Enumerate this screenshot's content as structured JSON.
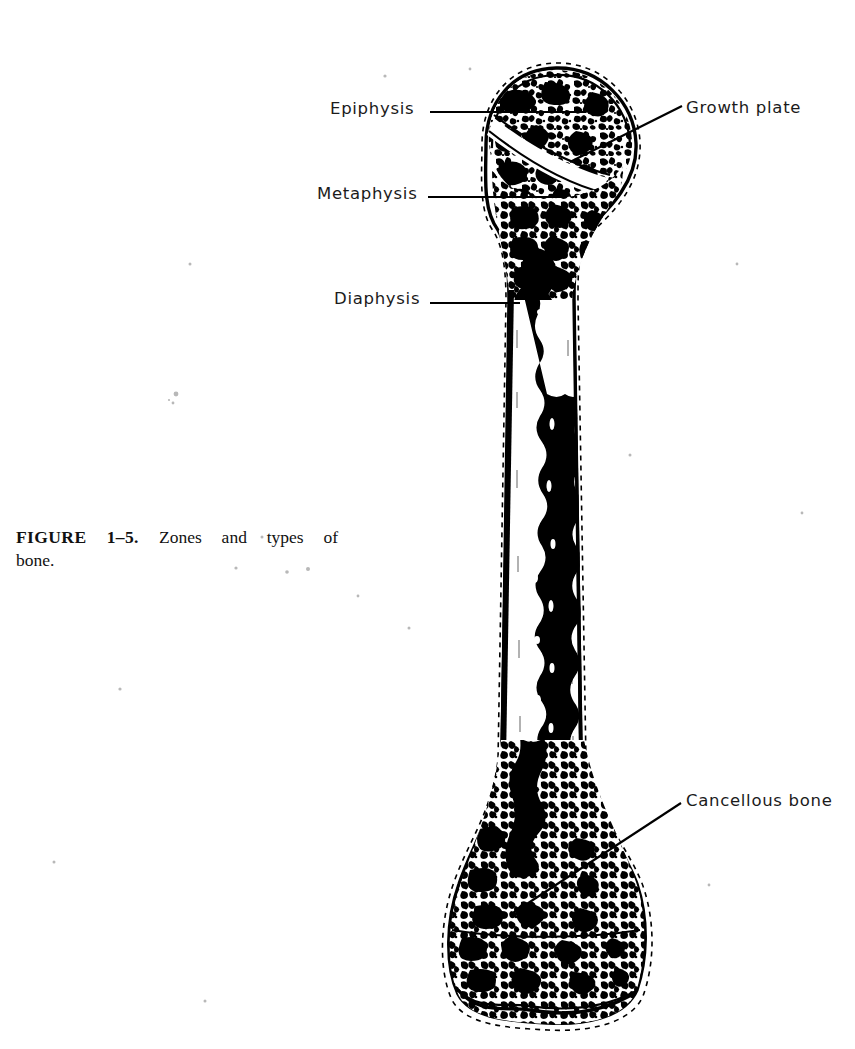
{
  "figure": {
    "caption_number": "FIGURE 1–5.",
    "caption_line1_rest": "Zones and types of",
    "caption_line2": "bone."
  },
  "labels": {
    "epiphysis": "Epiphysis",
    "metaphysis": "Metaphysis",
    "diaphysis": "Diaphysis",
    "growth_plate": "Growth plate",
    "cancellous_bone": "Cancellous bone"
  },
  "colors": {
    "ink": "#000000",
    "paper": "#ffffff",
    "text": "#1b1b1b",
    "speck": "#b8b8b8"
  },
  "illustration": {
    "subject": "long-bone-longitudinal-section",
    "regions": [
      "proximal-epiphysis",
      "growth-plate",
      "metaphysis",
      "diaphysis",
      "medullary-cavity",
      "distal-metaphysis",
      "distal-epiphysis"
    ]
  }
}
